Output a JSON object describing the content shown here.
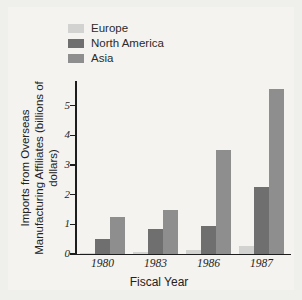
{
  "chart_data": {
    "type": "bar",
    "title": "",
    "xlabel": "Fiscal Year",
    "ylabel": "Imports from Overseas Manufacturing Affiliates (billions of dollars)",
    "ylabel_line1": "Imports from Overseas",
    "ylabel_line2": "Manufacturing Affiliates (billions of dollars)",
    "categories": [
      "1980",
      "1983",
      "1986",
      "1987"
    ],
    "series": [
      {
        "name": "Europe",
        "color": "#d2d2d0",
        "values": [
          0.05,
          0.08,
          0.13,
          0.28
        ]
      },
      {
        "name": "North America",
        "color": "#6f6f6f",
        "values": [
          0.5,
          0.85,
          0.95,
          2.25
        ]
      },
      {
        "name": "Asia",
        "color": "#8e8e8e",
        "values": [
          1.25,
          1.5,
          3.5,
          5.55
        ]
      }
    ],
    "ylim": [
      0,
      5.8
    ],
    "yticks": [
      "0",
      "1",
      "2",
      "3",
      "4",
      "5"
    ],
    "ytick_values": [
      0,
      1,
      2,
      3,
      4,
      5
    ],
    "grid": false,
    "legend_position": "top-left",
    "background_color": "#f4f3f0"
  }
}
